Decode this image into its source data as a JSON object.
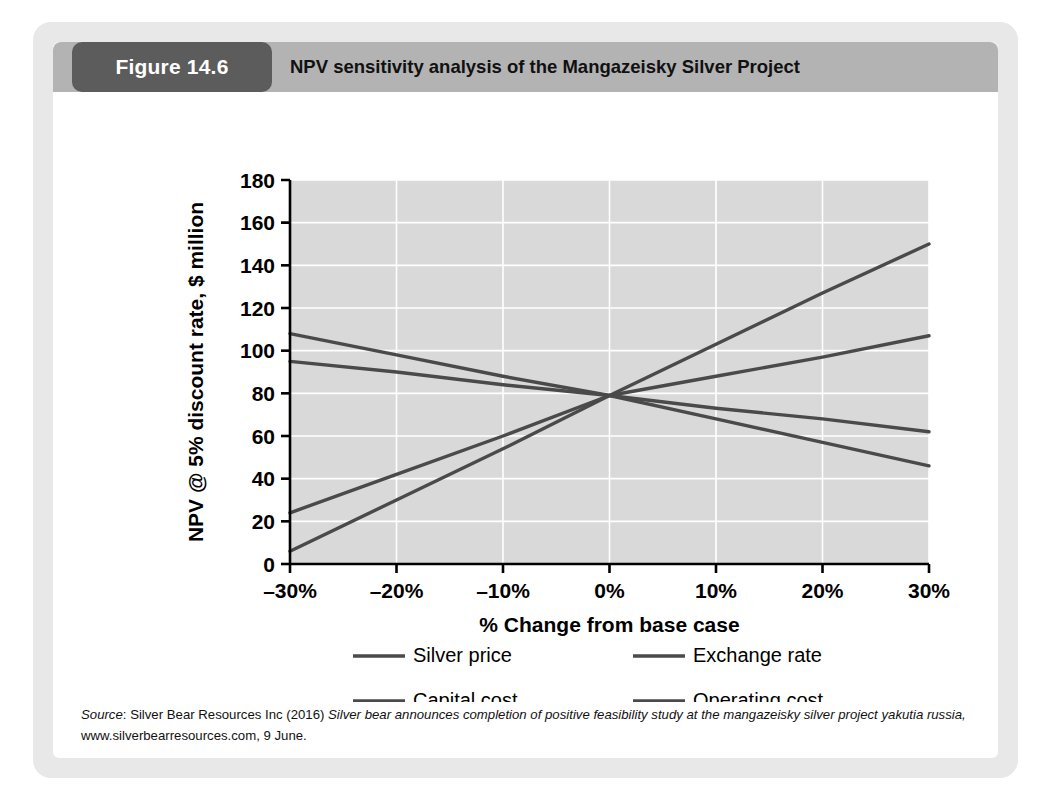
{
  "figure": {
    "number_label": "Figure 14.6",
    "title": "NPV sensitivity analysis  of the Mangazeisky Silver Project",
    "badge_color": "#5c5c5c",
    "header_color": "#b3b3b3",
    "frame_color": "#e8e8e8"
  },
  "source": {
    "label": "Source",
    "separator": ": ",
    "publisher": "Silver Bear Resources Inc (2016) ",
    "title_italic": "Silver bear announces completion of positive feasibility study at the mangazeisky silver project yakutia russia,",
    "tail": " www.silverbearresources.com, 9 June.",
    "full_text": "Source: Silver Bear Resources Inc (2016) Silver bear announces completion of positive feasibility study at the mangazeisky silver project yakutia russia, www.silverbearresources.com, 9 June."
  },
  "chart_data": {
    "type": "line",
    "title": "NPV sensitivity analysis  of the Mangazeisky Silver Project",
    "xlabel": "% Change from base case",
    "ylabel": "NPV @ 5% discount rate, $ million",
    "x": [
      -30,
      -20,
      -10,
      0,
      10,
      20,
      30
    ],
    "xtick_labels": [
      "–30%",
      "–20%",
      "–10%",
      "0%",
      "10%",
      "20%",
      "30%"
    ],
    "ytick_labels": [
      "0",
      "20",
      "40",
      "60",
      "80",
      "100",
      "120",
      "140",
      "160",
      "180"
    ],
    "yticks": [
      0,
      20,
      40,
      60,
      80,
      100,
      120,
      140,
      160,
      180
    ],
    "xlim": [
      -30,
      30
    ],
    "ylim": [
      0,
      180
    ],
    "grid": true,
    "grid_color": "#ffffff",
    "plot_background": "#d9d9d9",
    "legend_position": "bottom",
    "line_color": "#4a4a4a",
    "series": [
      {
        "name": "Silver price",
        "values": [
          6,
          30,
          54,
          79,
          103,
          127,
          150
        ]
      },
      {
        "name": "Exchange rate",
        "values": [
          24,
          42,
          60,
          79,
          88,
          97,
          107
        ]
      },
      {
        "name": "Capital cost",
        "values": [
          95,
          90,
          84,
          79,
          73,
          68,
          62
        ]
      },
      {
        "name": "Operating cost",
        "values": [
          108,
          98,
          88,
          79,
          68,
          57,
          46
        ]
      }
    ]
  },
  "legend": {
    "items": [
      {
        "label": "Silver price"
      },
      {
        "label": "Exchange rate"
      },
      {
        "label": "Capital cost"
      },
      {
        "label": "Operating cost"
      }
    ]
  }
}
